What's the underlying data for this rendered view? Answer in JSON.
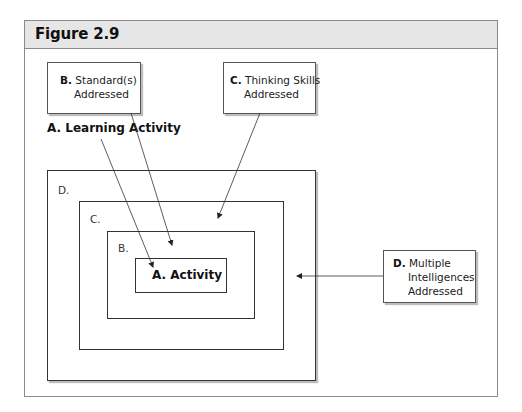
{
  "figure": {
    "title": "Figure 2.9"
  },
  "callouts": {
    "standards": {
      "letter": "B.",
      "line1": "Standard(s)",
      "line2": "Addressed"
    },
    "thinking": {
      "letter": "C.",
      "line1": "Thinking Skills",
      "line2": "Addressed"
    },
    "intelligences": {
      "letter": "D.",
      "line1": "Multiple",
      "line2": "Intelligences",
      "line3": "Addressed"
    }
  },
  "learning_activity_label": "A. Learning Activity",
  "nested_boxes": {
    "d_label": "D.",
    "c_label": "C.",
    "b_label": "B.",
    "a_label": "A. Activity"
  },
  "arrows": [
    {
      "from": "A. Learning Activity",
      "to": "A. Activity"
    },
    {
      "from": "B. Standard(s) Addressed",
      "to": "B. box"
    },
    {
      "from": "C. Thinking Skills Addressed",
      "to": "C. box"
    },
    {
      "from": "D. Multiple Intelligences Addressed",
      "to": "D. box"
    }
  ],
  "colors": {
    "header_bg": "#e6e6e6",
    "border": "#333333",
    "frame_border": "#8a8a8a"
  }
}
